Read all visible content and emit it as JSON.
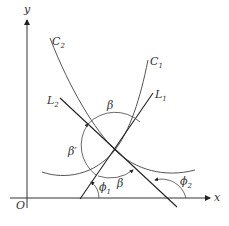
{
  "diagram": {
    "axes": {
      "x_label": "x",
      "y_label": "y",
      "origin_label": "O"
    },
    "curves": [
      {
        "id": "C1",
        "label": "C",
        "sub": "1"
      },
      {
        "id": "C2",
        "label": "C",
        "sub": "2"
      }
    ],
    "lines": [
      {
        "id": "L1",
        "label": "L",
        "sub": "1"
      },
      {
        "id": "L2",
        "label": "L",
        "sub": "2"
      }
    ],
    "angles": [
      {
        "id": "beta_top",
        "label": "β"
      },
      {
        "id": "beta_prime",
        "label": "β′"
      },
      {
        "id": "beta_bottom",
        "label": "β"
      },
      {
        "id": "phi1",
        "label": "ϕ",
        "sub": "1"
      },
      {
        "id": "phi2",
        "label": "ϕ",
        "sub": "2"
      }
    ],
    "colors": {
      "stroke": "#333333",
      "background": "#ffffff"
    }
  }
}
